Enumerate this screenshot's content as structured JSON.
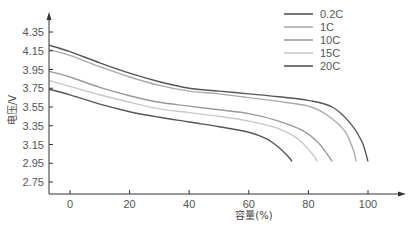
{
  "chart_data": {
    "type": "line",
    "title": "",
    "xlabel": "容量(%)",
    "ylabel": "电压/V",
    "xlim": [
      -7,
      115
    ],
    "ylim": [
      2.65,
      4.5
    ],
    "x_ticks": [
      "0",
      "20",
      "40",
      "60",
      "80",
      "100"
    ],
    "y_ticks": [
      "4.35",
      "4.15",
      "3.95",
      "3.75",
      "3.55",
      "3.35",
      "3.15",
      "2.95",
      "2.75"
    ],
    "grid": false,
    "legend_position": "top-right",
    "series": [
      {
        "name": "0.2C",
        "color": "#555555",
        "x": [
          -7,
          0,
          10,
          20,
          30,
          40,
          50,
          60,
          70,
          80,
          88,
          94,
          98,
          100
        ],
        "y": [
          4.21,
          4.14,
          4.02,
          3.91,
          3.82,
          3.75,
          3.72,
          3.69,
          3.66,
          3.62,
          3.55,
          3.38,
          3.18,
          2.97
        ]
      },
      {
        "name": "1C",
        "color": "#aaaaaa",
        "x": [
          -7,
          0,
          10,
          20,
          30,
          40,
          50,
          60,
          70,
          80,
          86,
          92,
          95,
          96
        ],
        "y": [
          4.16,
          4.1,
          3.98,
          3.87,
          3.78,
          3.72,
          3.69,
          3.65,
          3.61,
          3.56,
          3.47,
          3.3,
          3.1,
          2.97
        ]
      },
      {
        "name": "10C",
        "color": "#999999",
        "x": [
          -7,
          0,
          10,
          20,
          30,
          40,
          50,
          60,
          70,
          78,
          83,
          86,
          88
        ],
        "y": [
          3.93,
          3.87,
          3.76,
          3.67,
          3.6,
          3.56,
          3.52,
          3.48,
          3.4,
          3.3,
          3.18,
          3.06,
          2.97
        ]
      },
      {
        "name": "15C",
        "color": "#c8c8c8",
        "x": [
          -7,
          0,
          10,
          20,
          30,
          40,
          50,
          60,
          70,
          76,
          80,
          82,
          83
        ],
        "y": [
          3.83,
          3.77,
          3.68,
          3.6,
          3.53,
          3.49,
          3.45,
          3.4,
          3.32,
          3.22,
          3.1,
          3.02,
          2.97
        ]
      },
      {
        "name": "20C",
        "color": "#555555",
        "x": [
          -7,
          0,
          10,
          20,
          30,
          40,
          50,
          60,
          66,
          70,
          73,
          74.5
        ],
        "y": [
          3.74,
          3.68,
          3.58,
          3.5,
          3.44,
          3.39,
          3.34,
          3.28,
          3.21,
          3.12,
          3.03,
          2.97
        ]
      }
    ]
  },
  "legend": [
    {
      "label": "0.2C",
      "color": "#555555"
    },
    {
      "label": "1C",
      "color": "#aaaaaa"
    },
    {
      "label": "10C",
      "color": "#999999"
    },
    {
      "label": "15C",
      "color": "#c8c8c8"
    },
    {
      "label": "20C",
      "color": "#555555"
    }
  ],
  "axes": {
    "y_label": "电压/V",
    "x_label": "容量(%)"
  }
}
